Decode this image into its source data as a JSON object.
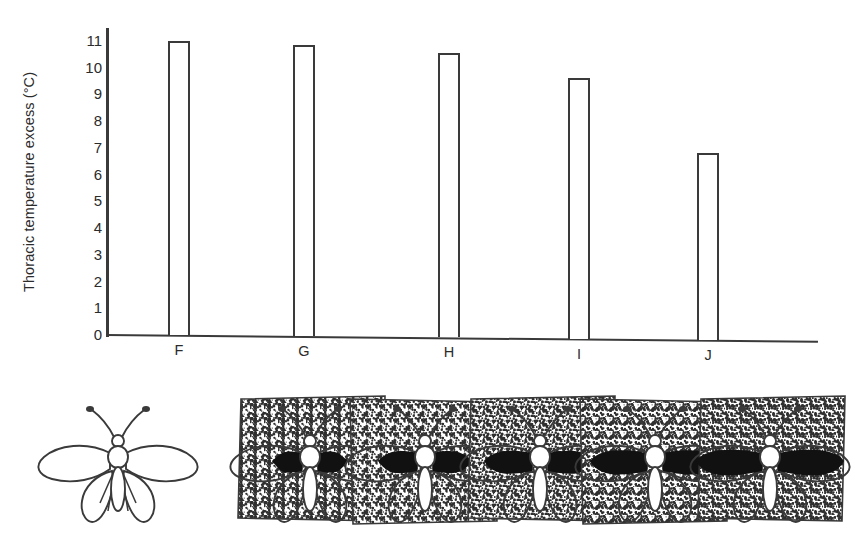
{
  "chart_data": {
    "type": "bar",
    "title": "",
    "xlabel": "",
    "ylabel": "Thoracic temperature excess (°C)",
    "categories": [
      "F",
      "G",
      "H",
      "I",
      "J"
    ],
    "values": [
      11.0,
      10.9,
      10.65,
      9.75,
      7.0
    ],
    "ylim": [
      0,
      11.4
    ],
    "yticks": [
      0,
      1,
      2,
      3,
      4,
      5,
      6,
      7,
      8,
      9,
      10,
      11
    ],
    "ytick_labels": [
      "0",
      "1",
      "2",
      "3",
      "4",
      "5",
      "6",
      "7",
      "8",
      "9",
      "10",
      "11"
    ],
    "grid": false,
    "legend": null,
    "bar_style": "open outline, white fill, dark outline",
    "series": [
      {
        "name": "Thoracic temperature excess",
        "values": [
          11.0,
          10.9,
          10.65,
          9.75,
          7.0
        ]
      }
    ]
  },
  "axis": {
    "y_title": "Thoracic temperature excess (°C)",
    "tick_labels": [
      "11",
      "10",
      "9",
      "8",
      "7",
      "6",
      "5",
      "4",
      "3",
      "2",
      "1",
      "0"
    ],
    "category_labels": [
      "F",
      "G",
      "H",
      "I",
      "J"
    ]
  },
  "specimens": {
    "caption": "",
    "items": [
      {
        "id": "outline-butterfly",
        "name": "white-outline-butterfly",
        "wing_pattern": "unmelanised outline only",
        "melanisation": 0,
        "has_background_patch": false
      },
      {
        "id": "specimen-F",
        "name": "butterfly-specimen-f",
        "wing_pattern": "small black basal wedge on stippled patch",
        "melanisation": 1,
        "has_background_patch": true
      },
      {
        "id": "specimen-G",
        "name": "butterfly-specimen-g",
        "wing_pattern": "enlarged black basal wedge on stippled patch",
        "melanisation": 2,
        "has_background_patch": true
      },
      {
        "id": "specimen-H",
        "name": "butterfly-specimen-h",
        "wing_pattern": "broad black wedge on stippled patch",
        "melanisation": 3,
        "has_background_patch": true
      },
      {
        "id": "specimen-I",
        "name": "butterfly-specimen-i",
        "wing_pattern": "extensive black wing with stippled margin",
        "melanisation": 4,
        "has_background_patch": true
      },
      {
        "id": "specimen-J",
        "name": "butterfly-specimen-j",
        "wing_pattern": "near fully black wing on stippled patch",
        "melanisation": 5,
        "has_background_patch": true
      }
    ]
  },
  "colors": {
    "ink": "#3a3a3a",
    "text": "#2b2b2b",
    "background": "#ffffff",
    "melanin_black": "#111111",
    "stipple_gray": "#8a8a8a"
  }
}
